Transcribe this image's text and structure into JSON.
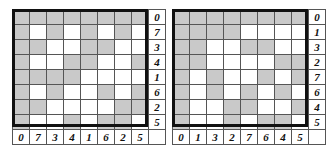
{
  "colors": {
    "shaded": "#c9c9c9",
    "blank": "#ffffff",
    "border": "#111111"
  },
  "left_grid": {
    "row_labels": [
      "0",
      "7",
      "3",
      "4",
      "1",
      "6",
      "2",
      "5"
    ],
    "col_labels": [
      "0",
      "7",
      "3",
      "4",
      "1",
      "6",
      "2",
      "5"
    ],
    "cells": [
      "GGGGGGGG",
      "GWGWGWGW",
      "GGWWGGWW",
      "GWWGGWWG",
      "GGGGWWWW",
      "GWGWWGWG",
      "GGWWWWGG",
      "GWWGWGGW"
    ]
  },
  "right_grid": {
    "row_labels": [
      "0",
      "1",
      "3",
      "2",
      "7",
      "6",
      "4",
      "5"
    ],
    "col_labels": [
      "0",
      "1",
      "3",
      "2",
      "7",
      "6",
      "4",
      "5"
    ],
    "cells": [
      "GGGGGGGG",
      "GGGGWWWW",
      "GGWWGGWW",
      "GGWWWWGG",
      "GWGWWGWG",
      "GWGWGWGW",
      "GWWGGWWG",
      "GWWGWGGW"
    ]
  }
}
